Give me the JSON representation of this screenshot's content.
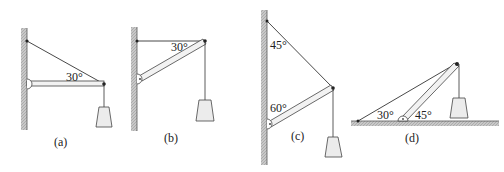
{
  "figures": [
    {
      "id": "a",
      "label": "(a)",
      "angles": [
        "30°"
      ]
    },
    {
      "id": "b",
      "label": "(b)",
      "angles": [
        "30°"
      ]
    },
    {
      "id": "c",
      "label": "(c)",
      "angles": [
        "45°",
        "60°"
      ]
    },
    {
      "id": "d",
      "label": "(d)",
      "angles": [
        "30°",
        "45°"
      ]
    }
  ],
  "colors": {
    "wall": "#b8b8b8",
    "line": "#333333",
    "weight_fill": "#ececec"
  }
}
